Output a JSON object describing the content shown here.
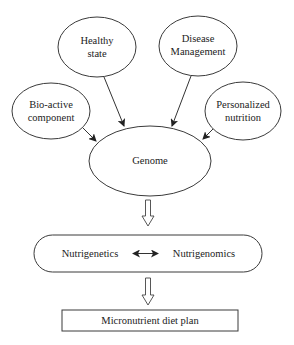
{
  "diagram": {
    "inputs": [
      {
        "id": "healthy",
        "lines": [
          "Healthy",
          "state"
        ]
      },
      {
        "id": "disease",
        "lines": [
          "Disease",
          "Management"
        ]
      },
      {
        "id": "bioactive",
        "lines": [
          "Bio-active",
          "component"
        ]
      },
      {
        "id": "personalized",
        "lines": [
          "Personalized",
          "nutrition"
        ]
      }
    ],
    "center": {
      "label": "Genome"
    },
    "process": {
      "left": "Nutrigenetics",
      "right": "Nutrigenomics",
      "relation": "bidirectional"
    },
    "output": {
      "label": "Micronutrient diet plan"
    },
    "edges": [
      {
        "from": "healthy",
        "to": "genome",
        "type": "arrow"
      },
      {
        "from": "disease",
        "to": "genome",
        "type": "arrow"
      },
      {
        "from": "bioactive",
        "to": "genome",
        "type": "arrow"
      },
      {
        "from": "personalized",
        "to": "genome",
        "type": "arrow"
      },
      {
        "from": "genome",
        "to": "process",
        "type": "hollow-arrow"
      },
      {
        "from": "process",
        "to": "output",
        "type": "hollow-arrow"
      }
    ]
  }
}
